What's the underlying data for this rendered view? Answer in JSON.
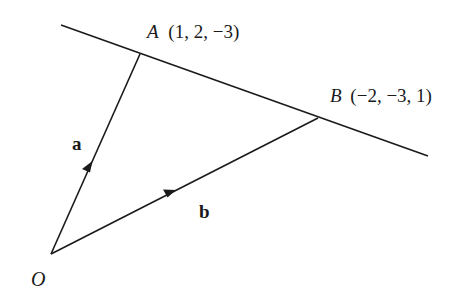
{
  "diagram": {
    "points": {
      "A": {
        "label": "A",
        "coords": "(1, 2, −3)"
      },
      "B": {
        "label": "B",
        "coords": "(−2, −3, 1)"
      },
      "O": {
        "label": "O"
      }
    },
    "vectors": {
      "a": {
        "label": "a",
        "from": "O",
        "to": "A"
      },
      "b": {
        "label": "b",
        "from": "O",
        "to": "B"
      }
    },
    "line": {
      "through": [
        "A",
        "B"
      ]
    },
    "colors": {
      "stroke": "#1a1a1a",
      "background": "#ffffff"
    }
  }
}
